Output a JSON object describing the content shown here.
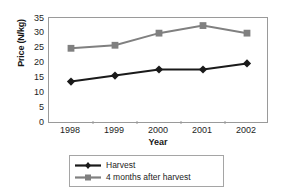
{
  "chart_data": {
    "type": "line",
    "title": "",
    "xlabel": "Year",
    "ylabel": "Price (N/kg)",
    "categories": [
      "1998",
      "1999",
      "2000",
      "2001",
      "2002"
    ],
    "ylim": [
      0,
      35
    ],
    "yticks": [
      0,
      5,
      10,
      15,
      20,
      25,
      30,
      35
    ],
    "grid": false,
    "legend_position": "bottom",
    "series": [
      {
        "name": "Harvest",
        "values": [
          14,
          16,
          18,
          18,
          20
        ],
        "color": "#1a1a1a",
        "marker": "diamond"
      },
      {
        "name": "4 months after harvest",
        "values": [
          25,
          26,
          30,
          32.5,
          30
        ],
        "color": "#808080",
        "marker": "square"
      }
    ]
  },
  "axes": {
    "ylabel": "Price (N/kg)",
    "xlabel": "Year",
    "ytick_labels": [
      "35",
      "30",
      "25",
      "20",
      "15",
      "10",
      "5",
      "0"
    ],
    "xtick_labels": [
      "1998",
      "1999",
      "2000",
      "2001",
      "2002"
    ]
  },
  "legend": {
    "items": [
      {
        "label": "Harvest"
      },
      {
        "label": "4 months after harvest"
      }
    ]
  },
  "colors": {
    "series_harvest": "#1a1a1a",
    "series_after_harvest": "#808080",
    "axis": "#9a9a9a",
    "text": "#1d1d1d",
    "background": "#ffffff"
  }
}
